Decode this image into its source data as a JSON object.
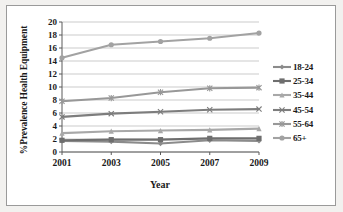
{
  "chart_data": {
    "type": "line",
    "title": "",
    "xlabel": "Year",
    "ylabel": "%Prevalence Health Equipment",
    "x": [
      2001,
      2003,
      2005,
      2007,
      2009
    ],
    "xtick_labels": [
      "2001",
      "2003",
      "2005",
      "2007",
      "2009"
    ],
    "ytick_labels": [
      "0",
      "2",
      "4",
      "6",
      "8",
      "10",
      "12",
      "14",
      "16",
      "18",
      "20"
    ],
    "ylim": [
      0,
      20
    ],
    "ytick_step": 2,
    "grid": "horizontal",
    "legend_position": "right",
    "series": [
      {
        "name": "18-24",
        "marker": "diamond",
        "color": "#8b8b8b",
        "values": [
          1.7,
          1.6,
          1.3,
          1.8,
          1.7
        ]
      },
      {
        "name": "25-34",
        "marker": "square",
        "color": "#6e6e6e",
        "values": [
          1.8,
          1.9,
          1.9,
          2.1,
          2.1
        ]
      },
      {
        "name": "35-44",
        "marker": "triangle",
        "color": "#a8a8a8",
        "values": [
          2.9,
          3.2,
          3.3,
          3.4,
          3.6
        ]
      },
      {
        "name": "45-54",
        "marker": "x",
        "color": "#7d7d7d",
        "values": [
          5.4,
          5.9,
          6.2,
          6.5,
          6.6
        ]
      },
      {
        "name": "55-64",
        "marker": "asterisk",
        "color": "#989898",
        "values": [
          7.8,
          8.3,
          9.2,
          9.8,
          9.9
        ]
      },
      {
        "name": "65+",
        "marker": "circle",
        "color": "#a2a2a2",
        "values": [
          14.5,
          16.5,
          17.0,
          17.5,
          18.3
        ]
      }
    ]
  },
  "legend": {
    "items": [
      "18-24",
      "25-34",
      "35-44",
      "45-54",
      "55-64",
      "65+"
    ]
  },
  "colors": {
    "frame": "#9a9a9a",
    "gridline": "#b5b5b5",
    "axis": "#5a5a5a",
    "text": "#1a1a1a",
    "page_background": "#f2f1ef",
    "plot_background": "#ffffff"
  }
}
